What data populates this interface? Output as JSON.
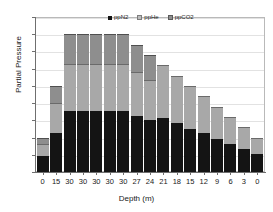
{
  "chart_data": {
    "type": "bar",
    "stacked": true,
    "title": "",
    "xlabel": "Depth (m)",
    "ylabel": "Partial Pressure",
    "categories": [
      "0",
      "15",
      "30",
      "30",
      "30",
      "30",
      "30",
      "27",
      "24",
      "21",
      "18",
      "15",
      "12",
      "9",
      "6",
      "3",
      "0"
    ],
    "ylim": [
      0,
      4.5
    ],
    "yticks": [
      "0",
      "0.5",
      "1",
      "1.5",
      "2",
      "2.5",
      "3",
      "3.5",
      "4",
      "4.5"
    ],
    "ytick_values": [
      0,
      0.5,
      1,
      1.5,
      2,
      2.5,
      3,
      3.5,
      4,
      4.5
    ],
    "grid": true,
    "legend_position": "top-center",
    "series": [
      {
        "name": "ppN2",
        "color": "#141414",
        "values": [
          0.47,
          1.13,
          1.78,
          1.78,
          1.78,
          1.78,
          1.78,
          1.63,
          1.51,
          1.56,
          1.41,
          1.26,
          1.12,
          0.97,
          0.81,
          0.66,
          0.52
        ]
      },
      {
        "name": "ppHe",
        "color": "#a8a8a8",
        "values": [
          0.35,
          0.87,
          1.37,
          1.37,
          1.37,
          1.37,
          1.37,
          1.28,
          1.15,
          1.55,
          1.38,
          1.24,
          1.08,
          0.93,
          0.79,
          0.64,
          0.48
        ]
      },
      {
        "name": "ppCO2",
        "color": "#8e8e8e",
        "values": [
          0.18,
          0.5,
          0.85,
          0.85,
          0.85,
          0.85,
          0.85,
          0.79,
          0.74,
          0.0,
          0.0,
          0.0,
          0.0,
          0.0,
          0.0,
          0.0,
          0.0
        ]
      }
    ],
    "totals": [
      1.0,
      2.5,
      4.0,
      4.0,
      4.0,
      4.0,
      4.0,
      3.7,
      3.4,
      3.11,
      2.79,
      2.5,
      2.2,
      1.9,
      1.6,
      1.3,
      1.0
    ]
  },
  "legend": {
    "items": [
      {
        "label": "ppN2"
      },
      {
        "label": "ppHe"
      },
      {
        "label": "ppCO2"
      }
    ]
  }
}
